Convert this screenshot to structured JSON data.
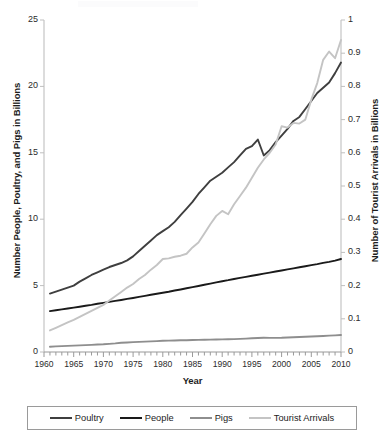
{
  "chart_data": {
    "type": "line",
    "title": "",
    "xlabel": "Year",
    "ylabel": "Number People, Poultry, and Pigs in Billions",
    "y2label": "Number of Tourist Arrivals in Billions",
    "xlim": [
      1960,
      2010
    ],
    "ylim": [
      0,
      25
    ],
    "y2lim": [
      0,
      1
    ],
    "xticks": [
      1960,
      1965,
      1970,
      1975,
      1980,
      1985,
      1990,
      1995,
      2000,
      2005,
      2010
    ],
    "xtick_labels": [
      "1960",
      "1965",
      "1970",
      "1975",
      "1980",
      "1985",
      "1990",
      "1995",
      "2000",
      "2005",
      "2010"
    ],
    "yticks": [
      0,
      5,
      10,
      15,
      20,
      25
    ],
    "ytick_labels": [
      "0",
      "5",
      "10",
      "15",
      "20",
      "25"
    ],
    "y2ticks": [
      0,
      0.1,
      0.2,
      0.3,
      0.4,
      0.5,
      0.6,
      0.7,
      0.8,
      0.9,
      1
    ],
    "y2tick_labels": [
      "0",
      "0.1",
      "0.2",
      "0.3",
      "0.4",
      "0.5",
      "0.6",
      "0.7",
      "0.8",
      "0.9",
      "1"
    ],
    "minor_xticks": true,
    "grid": false,
    "legend_position": "bottom",
    "x": [
      1961,
      1962,
      1963,
      1964,
      1965,
      1966,
      1967,
      1968,
      1969,
      1970,
      1971,
      1972,
      1973,
      1974,
      1975,
      1976,
      1977,
      1978,
      1979,
      1980,
      1981,
      1982,
      1983,
      1984,
      1985,
      1986,
      1987,
      1988,
      1989,
      1990,
      1991,
      1992,
      1993,
      1994,
      1995,
      1996,
      1997,
      1998,
      1999,
      2000,
      2001,
      2002,
      2003,
      2004,
      2005,
      2006,
      2007,
      2008,
      2009,
      2010
    ],
    "series": [
      {
        "name": "Poultry",
        "axis": "left",
        "color": "#3f3f3f",
        "unit": "billions",
        "values": [
          4.4,
          4.55,
          4.7,
          4.85,
          5.0,
          5.3,
          5.55,
          5.8,
          6.0,
          6.2,
          6.4,
          6.55,
          6.7,
          6.9,
          7.2,
          7.6,
          8.0,
          8.4,
          8.8,
          9.1,
          9.4,
          9.8,
          10.3,
          10.8,
          11.3,
          11.9,
          12.4,
          12.9,
          13.2,
          13.5,
          13.9,
          14.3,
          14.8,
          15.3,
          15.5,
          16.0,
          14.8,
          15.2,
          15.8,
          16.3,
          16.8,
          17.4,
          17.7,
          18.3,
          18.9,
          19.5,
          19.9,
          20.3,
          21.0,
          21.8
        ]
      },
      {
        "name": "People",
        "axis": "left",
        "color": "#1a1a1a",
        "unit": "billions",
        "values": [
          3.08,
          3.14,
          3.21,
          3.28,
          3.34,
          3.41,
          3.48,
          3.55,
          3.63,
          3.7,
          3.77,
          3.85,
          3.92,
          4.0,
          4.07,
          4.15,
          4.23,
          4.31,
          4.39,
          4.46,
          4.54,
          4.63,
          4.71,
          4.8,
          4.88,
          4.97,
          5.06,
          5.15,
          5.24,
          5.33,
          5.41,
          5.5,
          5.58,
          5.66,
          5.74,
          5.82,
          5.9,
          5.98,
          6.06,
          6.14,
          6.22,
          6.3,
          6.38,
          6.46,
          6.54,
          6.62,
          6.71,
          6.79,
          6.88,
          7.0
        ]
      },
      {
        "name": "Pigs",
        "axis": "left",
        "color": "#8e8e8e",
        "unit": "billions",
        "values": [
          0.4,
          0.42,
          0.44,
          0.46,
          0.48,
          0.5,
          0.52,
          0.54,
          0.56,
          0.58,
          0.61,
          0.65,
          0.7,
          0.72,
          0.74,
          0.76,
          0.78,
          0.8,
          0.82,
          0.85,
          0.86,
          0.87,
          0.88,
          0.89,
          0.9,
          0.91,
          0.92,
          0.93,
          0.94,
          0.95,
          0.96,
          0.97,
          0.99,
          1.01,
          1.03,
          1.05,
          1.07,
          1.06,
          1.06,
          1.07,
          1.09,
          1.11,
          1.13,
          1.15,
          1.17,
          1.19,
          1.21,
          1.23,
          1.25,
          1.28
        ]
      },
      {
        "name": "Tourist Arrivals",
        "axis": "right",
        "color": "#c4c4c4",
        "unit": "billions",
        "values": [
          0.065,
          0.073,
          0.081,
          0.089,
          0.097,
          0.106,
          0.115,
          0.124,
          0.133,
          0.142,
          0.155,
          0.168,
          0.181,
          0.194,
          0.205,
          0.22,
          0.232,
          0.248,
          0.262,
          0.28,
          0.282,
          0.287,
          0.29,
          0.296,
          0.315,
          0.33,
          0.357,
          0.385,
          0.41,
          0.425,
          0.415,
          0.445,
          0.47,
          0.495,
          0.525,
          0.555,
          0.58,
          0.6,
          0.625,
          0.68,
          0.676,
          0.69,
          0.688,
          0.7,
          0.76,
          0.81,
          0.88,
          0.905,
          0.885,
          0.94
        ]
      }
    ]
  },
  "axes": {
    "left_title": "Number People, Poultry, and Pigs in Billions",
    "right_title": "Number of Tourist Arrivals in Billions",
    "x_title": "Year"
  },
  "legend": {
    "entries": [
      {
        "label": "Poultry",
        "color": "#3f3f3f"
      },
      {
        "label": "People",
        "color": "#1a1a1a"
      },
      {
        "label": "Pigs",
        "color": "#8e8e8e"
      },
      {
        "label": "Tourist Arrivals",
        "color": "#c4c4c4"
      }
    ]
  }
}
